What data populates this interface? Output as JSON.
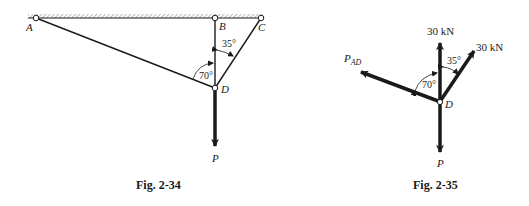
{
  "fig1": {
    "caption": "Fig. 2-34",
    "points": {
      "A": "A",
      "B": "B",
      "C": "C",
      "D": "D"
    },
    "angles": {
      "abd_adb": "70°",
      "bdc": "35°"
    },
    "load_label": "P"
  },
  "fig2": {
    "caption": "Fig. 2-35",
    "point": "D",
    "forces": {
      "vertical": "30 kN",
      "inclined": "30 kN",
      "pad_main": "P",
      "pad_sub": "AD",
      "load": "P"
    },
    "angles": {
      "left": "70°",
      "right": "35°"
    }
  },
  "colors": {
    "ink": "#1a1a1a",
    "hatch": "#8c8c8c",
    "background": "#ffffff"
  }
}
